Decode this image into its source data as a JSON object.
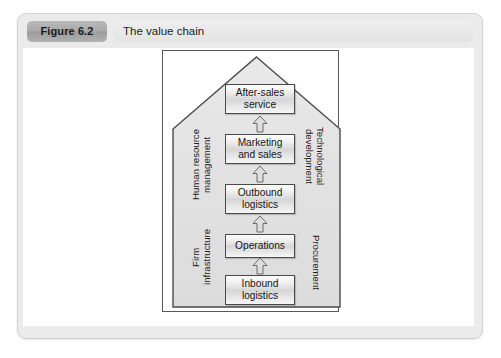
{
  "figure": {
    "number_label": "Figure 6.2",
    "title": "The value chain"
  },
  "diagram": {
    "type": "porter-value-chain",
    "support_activities": [
      {
        "id": "human-resource-management",
        "side": "left",
        "lines": [
          "Human resource",
          "management"
        ]
      },
      {
        "id": "firm-infrastructure",
        "side": "left",
        "lines": [
          "Firm",
          "infrastructure"
        ]
      },
      {
        "id": "technological-development",
        "side": "right",
        "lines": [
          "Technological",
          "development"
        ]
      },
      {
        "id": "procurement",
        "side": "right",
        "lines": [
          "Procurement"
        ]
      }
    ],
    "primary_activities": [
      {
        "id": "after-sales-service",
        "lines": [
          "After-sales",
          "service"
        ]
      },
      {
        "id": "marketing-and-sales",
        "lines": [
          "Marketing",
          "and sales"
        ]
      },
      {
        "id": "outbound-logistics",
        "lines": [
          "Outbound",
          "logistics"
        ]
      },
      {
        "id": "operations",
        "lines": [
          "Operations"
        ]
      },
      {
        "id": "inbound-logistics",
        "lines": [
          "Inbound",
          "logistics"
        ]
      }
    ],
    "flow_direction": "bottom-to-top",
    "arrow_count": 4,
    "labels": {
      "human_resource_line1": "Human resource",
      "human_resource_line2": "management",
      "firm_infra_line1": "Firm",
      "firm_infra_line2": "infrastructure",
      "technological_line1": "Technological",
      "technological_line2": "development",
      "procurement_line1": "Procurement",
      "after_sales_line1": "After-sales",
      "after_sales_line2": "service",
      "marketing_line1": "Marketing",
      "marketing_line2": "and sales",
      "outbound_line1": "Outbound",
      "outbound_line2": "logistics",
      "operations_line1": "Operations",
      "inbound_line1": "Inbound",
      "inbound_line2": "logistics"
    }
  },
  "colors": {
    "card_background": "#ebebeb",
    "pill_background": "#a9a9a9",
    "title_background": "#e6e6e6",
    "house_fill": "#e3e3e3",
    "house_stroke": "#4a4a4a",
    "box_stroke": "#4a4a4a",
    "text": "#1b1b1b"
  }
}
